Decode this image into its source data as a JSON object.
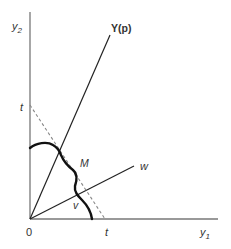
{
  "diagram": {
    "type": "economics-production-set",
    "axes": {
      "y_label": "y",
      "y_label_sub": "2",
      "x_label": "y",
      "x_label_sub": "1",
      "origin_label": "0"
    },
    "rays": [
      {
        "id": "price-ray",
        "label": "Y(p)"
      },
      {
        "id": "w-ray",
        "label": "w"
      }
    ],
    "budget_line": {
      "label_y_intercept": "t",
      "label_x_intercept": "t",
      "style": "dashed"
    },
    "frontier": {
      "style": "thick-wavy"
    },
    "point_labels": {
      "M": "M",
      "v": "v"
    }
  }
}
